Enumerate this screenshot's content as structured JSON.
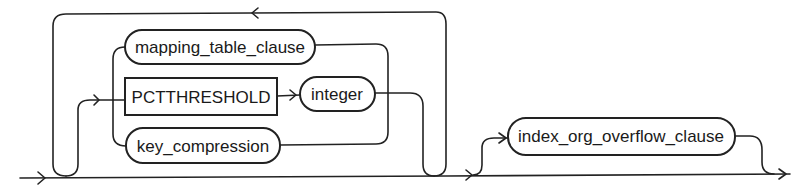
{
  "diagram": {
    "type": "railroad-syntax-diagram",
    "nodes": {
      "mapping_table_clause": {
        "label": "mapping_table_clause",
        "kind": "nonterminal"
      },
      "pctthreshold": {
        "label": "PCTTHRESHOLD",
        "kind": "keyword"
      },
      "integer": {
        "label": "integer",
        "kind": "nonterminal"
      },
      "key_compression": {
        "label": "key_compression",
        "kind": "nonterminal"
      },
      "index_org_overflow_clause": {
        "label": "index_org_overflow_clause",
        "kind": "nonterminal"
      }
    },
    "structure": {
      "loop": "repeatable group of optional choices: mapping_table_clause | PCTTHRESHOLD integer | key_compression",
      "optional": "index_org_overflow_clause"
    },
    "colors": {
      "line": "#222222",
      "background": "#ffffff",
      "text": "#1a1a1a"
    }
  }
}
